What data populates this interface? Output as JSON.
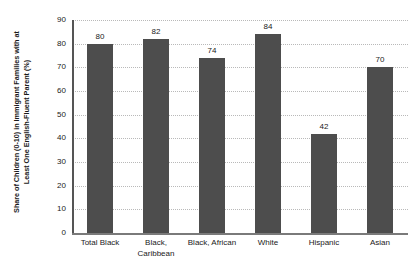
{
  "chart_data": {
    "type": "bar",
    "title": "",
    "subtitle": "",
    "xlabel": "",
    "ylabel": "Share of Children (0-10) in Immigrant Families with at Least One English-Fluent Parent (%)",
    "ylabel_line1": "Share of Children (0-10) in Immigrant Families with at",
    "ylabel_line2": "Least One English-Fluent Parent (%)",
    "categories": [
      "Total Black",
      "Black, Caribbean",
      "Black, African",
      "White",
      "Hispanic",
      "Asian"
    ],
    "category_lines": [
      [
        "Total Black",
        ""
      ],
      [
        "Black,",
        "Caribbean"
      ],
      [
        "Black, African",
        ""
      ],
      [
        "White",
        ""
      ],
      [
        "Hispanic",
        ""
      ],
      [
        "Asian",
        ""
      ]
    ],
    "values": [
      80,
      82,
      74,
      84,
      42,
      70
    ],
    "value_labels": [
      "80",
      "82",
      "74",
      "84",
      "42",
      "70"
    ],
    "ylim": [
      0,
      90
    ],
    "ytick_step": 10,
    "ytick_labels": [
      "90",
      "80",
      "70",
      "60",
      "50",
      "40",
      "30",
      "20",
      "10",
      "0"
    ],
    "ytick_values": [
      90,
      80,
      70,
      60,
      50,
      40,
      30,
      20,
      10,
      0
    ],
    "grid": true,
    "grid_axis": "y",
    "grid_style": "dotted",
    "legend": false,
    "legend_position": "none",
    "colors": {
      "bar": "#4d4d4d",
      "gridline": "#b9b9b9",
      "axis": "#555555",
      "baseline": "#7a7a7a",
      "text": "#1a1a1a",
      "background": "#ffffff"
    }
  }
}
